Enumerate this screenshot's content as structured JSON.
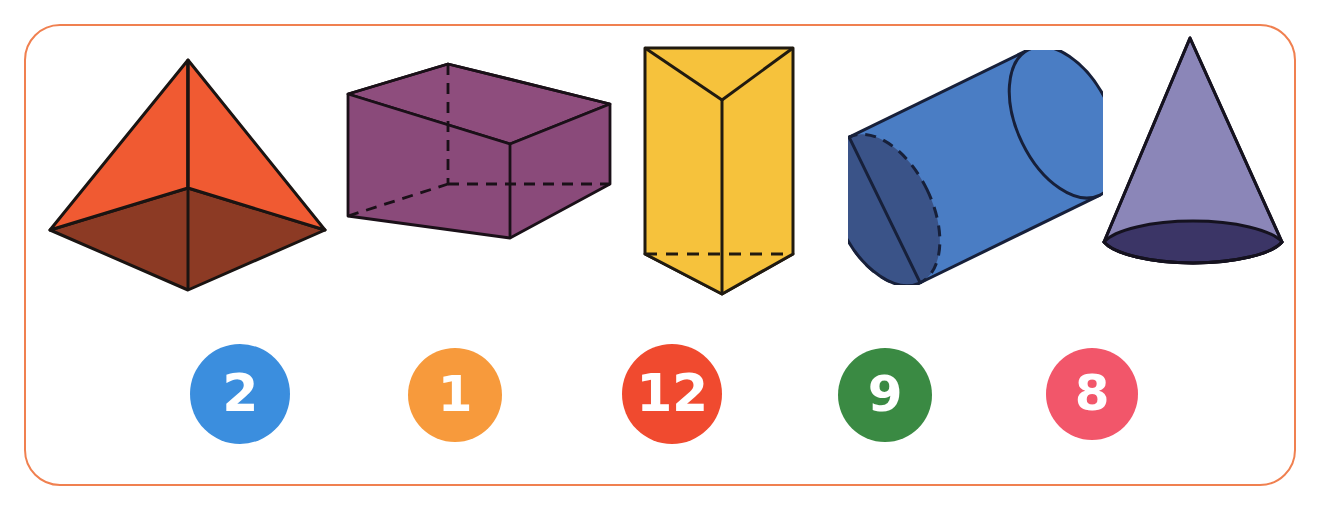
{
  "worksheet": {
    "title": "3D Shapes and Number Tokens",
    "frame": {
      "border_color": "#f08050",
      "background_color": "#ffffff",
      "corner_radius": "36px",
      "name": "rounded-orange-frame"
    }
  },
  "shapes": [
    {
      "id": "pyramid",
      "name": "square-pyramid",
      "label": "Square Pyramid",
      "face_color": "#f05a32",
      "base_color": "#8c3a24",
      "outline_color": "#1a1412",
      "x": 48,
      "y": 55,
      "width": 275,
      "height": 235
    },
    {
      "id": "rectangular-prism",
      "name": "rectangular-prism",
      "label": "Rectangular Prism",
      "face_color": "#8a4a7a",
      "top_color": "#8e4d7d",
      "base_color": "#5b5195",
      "outline_color": "#1a1018",
      "x": 345,
      "y": 62,
      "width": 270,
      "height": 185
    },
    {
      "id": "triangular-prism",
      "name": "triangular-prism",
      "label": "Triangular Prism",
      "face_color": "#f6c23c",
      "base_color": "#f2932e",
      "outline_color": "#201a10",
      "x": 643,
      "y": 46,
      "width": 150,
      "height": 248
    },
    {
      "id": "cylinder",
      "name": "cylinder",
      "label": "Cylinder",
      "face_color": "#4a7dc4",
      "back_color": "#3a5388",
      "outline_color": "#17203a",
      "x": 856,
      "y": 58,
      "width": 235,
      "height": 215
    },
    {
      "id": "cone",
      "name": "cone",
      "label": "Cone",
      "face_color": "#8b86b8",
      "base_color": "#3b3566",
      "outline_color": "#15121f",
      "x": 1100,
      "y": 36,
      "width": 190,
      "height": 228
    }
  ],
  "number_tokens": [
    {
      "id": "token-1",
      "name": "number-token-2",
      "value": "2",
      "color": "#3b8ede",
      "x": 190,
      "y": 344,
      "size": 100,
      "font_size": 52
    },
    {
      "id": "token-2",
      "name": "number-token-1",
      "value": "1",
      "color": "#f79a3c",
      "x": 408,
      "y": 348,
      "size": 94,
      "font_size": 50
    },
    {
      "id": "token-3",
      "name": "number-token-12",
      "value": "12",
      "color": "#f04a2f",
      "x": 622,
      "y": 344,
      "size": 100,
      "font_size": 52
    },
    {
      "id": "token-4",
      "name": "number-token-9",
      "value": "9",
      "color": "#3a8a43",
      "x": 838,
      "y": 348,
      "size": 94,
      "font_size": 50
    },
    {
      "id": "token-5",
      "name": "number-token-8",
      "value": "8",
      "color": "#f2566a",
      "x": 1046,
      "y": 348,
      "size": 92,
      "font_size": 50
    }
  ]
}
